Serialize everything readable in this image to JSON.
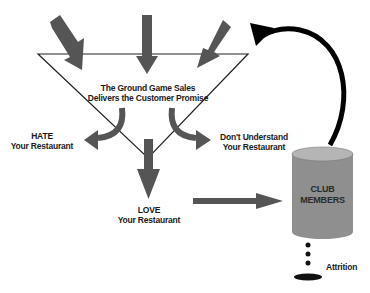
{
  "diagram": {
    "center_text": {
      "line1": "The Ground Game Sales",
      "line2": "Delivers the Customer Promise"
    },
    "outcomes": {
      "hate": {
        "line1": "HATE",
        "line2": "Your Restaurant"
      },
      "dont_understand": {
        "line1": "Don't Understand",
        "line2": "Your Restaurant"
      },
      "love": {
        "line1": "LOVE",
        "line2": "Your Restaurant"
      }
    },
    "cylinder": {
      "line1": "CLUB",
      "line2": "MEMBERS"
    },
    "attrition_label": "Attrition",
    "colors": {
      "arrow_gray": "#555555",
      "feedback_arrow": "#000000",
      "cylinder_fill": "#8f8f8f",
      "cylinder_top": "#b5b5b5",
      "line": "#222222"
    },
    "edges": [
      {
        "from": "input-arrows",
        "to": "funnel",
        "label": ""
      },
      {
        "from": "funnel",
        "to": "hate",
        "label": ""
      },
      {
        "from": "funnel",
        "to": "dont-understand",
        "label": ""
      },
      {
        "from": "funnel",
        "to": "love",
        "label": ""
      },
      {
        "from": "love",
        "to": "club-members",
        "label": ""
      },
      {
        "from": "club-members",
        "to": "funnel",
        "label": "feedback loop"
      },
      {
        "from": "club-members",
        "to": "attrition",
        "label": ""
      }
    ]
  }
}
